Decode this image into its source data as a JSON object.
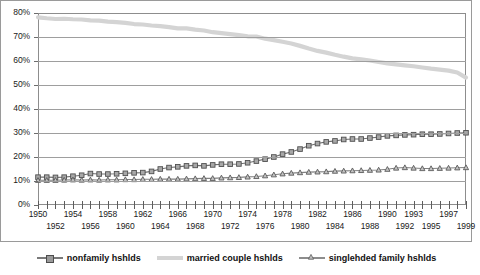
{
  "chart_data": {
    "type": "line",
    "title": "",
    "subtitle": "",
    "xlabel": "",
    "ylabel": "",
    "ylim": [
      0,
      80
    ],
    "yticks": [
      "0%",
      "10%",
      "20%",
      "30%",
      "40%",
      "50%",
      "60%",
      "70%",
      "80%"
    ],
    "ytick_values": [
      0,
      10,
      20,
      30,
      40,
      50,
      60,
      70,
      80
    ],
    "grid": true,
    "legend_position": "bottom",
    "xlim": [
      1950,
      1999
    ],
    "x": [
      1950,
      1951,
      1952,
      1953,
      1954,
      1955,
      1956,
      1957,
      1958,
      1959,
      1960,
      1961,
      1962,
      1963,
      1964,
      1965,
      1966,
      1967,
      1968,
      1969,
      1970,
      1971,
      1972,
      1973,
      1974,
      1975,
      1976,
      1977,
      1978,
      1979,
      1980,
      1981,
      1982,
      1983,
      1984,
      1985,
      1986,
      1987,
      1988,
      1989,
      1990,
      1991,
      1992,
      1993,
      1994,
      1995,
      1996,
      1997,
      1998,
      1999
    ],
    "xtick_labels_row1": [
      "1950",
      "1954",
      "1958",
      "1962",
      "1966",
      "1970",
      "1974",
      "1978",
      "1982",
      "1986",
      "1990",
      "1993",
      "1997"
    ],
    "xtick_labels_row2": [
      "1952",
      "1956",
      "1960",
      "1964",
      "1968",
      "1972",
      "1976",
      "1980",
      "1984",
      "1988",
      "1992",
      "1995",
      "1999"
    ],
    "xtick_row1_years": [
      1950,
      1954,
      1958,
      1962,
      1966,
      1970,
      1974,
      1978,
      1982,
      1986,
      1990,
      1993,
      1997
    ],
    "xtick_row2_years": [
      1952,
      1956,
      1960,
      1964,
      1968,
      1972,
      1976,
      1980,
      1984,
      1988,
      1992,
      1995,
      1999
    ],
    "series": [
      {
        "name": "nonfamily hshlds",
        "marker": "square",
        "color": "#6f6f6f",
        "values": [
          11.6,
          11.6,
          11.5,
          11.6,
          12.0,
          12.4,
          13.1,
          12.9,
          12.9,
          13.0,
          13.2,
          13.4,
          13.5,
          14.0,
          15.0,
          15.6,
          15.9,
          16.3,
          16.5,
          16.3,
          16.7,
          17.0,
          17.0,
          17.1,
          17.6,
          18.3,
          19.1,
          20.0,
          21.2,
          22.1,
          23.3,
          24.7,
          25.6,
          26.3,
          26.7,
          27.3,
          27.5,
          27.5,
          27.9,
          28.3,
          28.8,
          29.0,
          29.2,
          29.3,
          29.5,
          29.5,
          29.6,
          29.8,
          30.0,
          30.1
        ]
      },
      {
        "name": "married couple hshlds",
        "marker": "none",
        "color": "#d4d4d4",
        "values": [
          78.2,
          77.8,
          77.5,
          77.6,
          77.4,
          77.3,
          76.9,
          76.8,
          76.4,
          76.2,
          75.9,
          75.4,
          75.2,
          74.8,
          74.5,
          74.1,
          73.6,
          73.6,
          73.1,
          72.7,
          72.0,
          71.6,
          71.2,
          70.8,
          70.3,
          70.2,
          69.3,
          68.7,
          68.0,
          67.3,
          66.3,
          65.2,
          64.2,
          63.5,
          62.6,
          61.8,
          61.1,
          60.7,
          60.2,
          59.6,
          59.0,
          58.6,
          58.2,
          57.8,
          57.3,
          56.8,
          56.4,
          56.0,
          55.2,
          53.1
        ]
      },
      {
        "name": "singlehded family hshlds",
        "marker": "triangle",
        "color": "#808080",
        "values": [
          10.3,
          10.3,
          10.3,
          10.4,
          10.5,
          10.4,
          10.5,
          10.4,
          10.5,
          10.5,
          10.6,
          10.6,
          10.7,
          10.7,
          10.8,
          10.8,
          10.8,
          10.9,
          11.0,
          11.1,
          11.1,
          11.3,
          11.4,
          11.5,
          11.7,
          11.9,
          12.2,
          12.6,
          13.0,
          13.3,
          13.5,
          13.7,
          13.8,
          13.9,
          14.1,
          14.2,
          14.3,
          14.4,
          14.5,
          14.6,
          14.9,
          15.4,
          15.6,
          15.4,
          15.2,
          15.2,
          15.3,
          15.4,
          15.5,
          15.6
        ]
      }
    ]
  },
  "legend": {
    "items": [
      {
        "label": "nonfamily hshlds"
      },
      {
        "label": "married couple hshlds"
      },
      {
        "label": "singlehded family hshlds"
      }
    ]
  }
}
